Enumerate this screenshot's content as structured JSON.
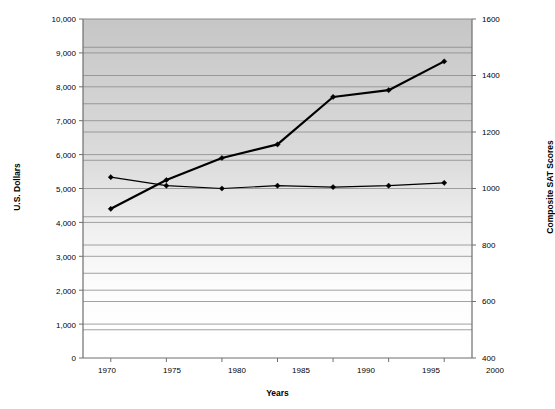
{
  "chart_data": {
    "type": "line",
    "title": "",
    "xlabel": "Years",
    "ylabel": "U.S. Dollars",
    "y2label": "Composite SAT Scores",
    "x": [
      1970,
      1975,
      1980,
      1985,
      1990,
      1995,
      2000
    ],
    "xtick_labels": [
      "1970",
      "1975",
      "1980",
      "1985",
      "1990",
      "1995",
      "2000"
    ],
    "xlim": [
      1967.5,
      2002.5
    ],
    "ylim": [
      0,
      10000
    ],
    "ytick_labels": [
      "0",
      "1,000",
      "2,000",
      "3,000",
      "4,000",
      "5,000",
      "6,000",
      "7,000",
      "8,000",
      "9,000",
      "10,000"
    ],
    "yticks": [
      0,
      1000,
      2000,
      3000,
      4000,
      5000,
      6000,
      7000,
      8000,
      9000,
      10000
    ],
    "y2lim": [
      400,
      1600
    ],
    "y2tick_labels": [
      "400",
      "600",
      "800",
      "1000",
      "1200",
      "1400",
      "1600"
    ],
    "y2ticks": [
      400,
      600,
      800,
      1000,
      1200,
      1400,
      1600
    ],
    "gridlines": true,
    "legend_position": "inline-annotations",
    "series": [
      {
        "name": "Total expenditures per pupil, 2000-01 constant dollars (left axis)",
        "axis": "left",
        "marker": "diamond",
        "line_width": 2.2,
        "color": "#000000",
        "values": [
          4400,
          5250,
          5900,
          6300,
          7700,
          7900,
          8750
        ]
      },
      {
        "name": "Average composite SAT scores (right axis)",
        "axis": "right",
        "marker": "diamond",
        "line_width": 1.2,
        "color": "#000000",
        "values": [
          1040,
          1010,
          1000,
          1010,
          1005,
          1010,
          1020
        ]
      }
    ],
    "annotations": [
      {
        "id": "expenditures",
        "text": "Total expenditures per pupil, 2000-01 constant dollars (left axis)"
      },
      {
        "id": "sat",
        "text": "Average composite SAT scores (right axis)"
      }
    ],
    "colors": {
      "plot_bg_top": "#c9c9c9",
      "plot_bg_bottom": "#ffffff",
      "gridline": "#8a8a8a",
      "axis": "#6e6e6e",
      "series": "#000000"
    }
  }
}
